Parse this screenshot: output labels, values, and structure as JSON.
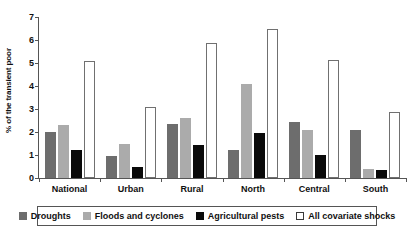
{
  "chart_data": {
    "type": "bar",
    "title": "",
    "xlabel": "",
    "ylabel": "% of the transient poor",
    "ylim": [
      0,
      7
    ],
    "ytick_labels": [
      "0",
      "1",
      "2",
      "3",
      "4",
      "5",
      "6",
      "7"
    ],
    "grid": false,
    "legend_position": "bottom",
    "categories": [
      "National",
      "Urban",
      "Rural",
      "North",
      "Central",
      "South"
    ],
    "series": [
      {
        "name": "Droughts",
        "color": "#6d6d6d",
        "values": [
          2.0,
          0.95,
          2.35,
          1.2,
          2.45,
          2.1
        ]
      },
      {
        "name": "Floods and cyclones",
        "color": "#ababab",
        "values": [
          2.3,
          1.5,
          2.6,
          4.1,
          2.1,
          0.4
        ]
      },
      {
        "name": "Agricultural pests",
        "color": "#0a0a0a",
        "values": [
          1.2,
          0.5,
          1.45,
          1.95,
          1.0,
          0.35
        ]
      },
      {
        "name": "All covariate shocks",
        "color": "#ffffff",
        "values": [
          5.1,
          3.1,
          5.85,
          6.5,
          5.15,
          2.85
        ]
      }
    ]
  }
}
